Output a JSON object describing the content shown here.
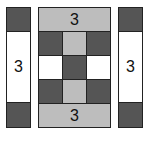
{
  "colors": {
    "dark": "#555555",
    "light": "#bdbdbd",
    "white": "#ffffff",
    "border": "#222222"
  },
  "left_strip": {
    "center_label": "3"
  },
  "right_strip": {
    "center_label": "3"
  },
  "center_block": {
    "top_band_label": "3",
    "bottom_band_label": "3",
    "grid": [
      [
        "dark",
        "light",
        "dark"
      ],
      [
        "white",
        "dark",
        "white"
      ],
      [
        "dark",
        "light",
        "dark"
      ]
    ]
  }
}
